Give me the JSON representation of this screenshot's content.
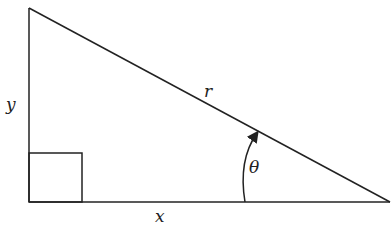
{
  "diagram": {
    "labels": {
      "opposite": "y",
      "adjacent": "x",
      "hypotenuse": "r",
      "angle": "θ"
    },
    "colors": {
      "stroke": "#222222",
      "background": "#ffffff"
    }
  }
}
